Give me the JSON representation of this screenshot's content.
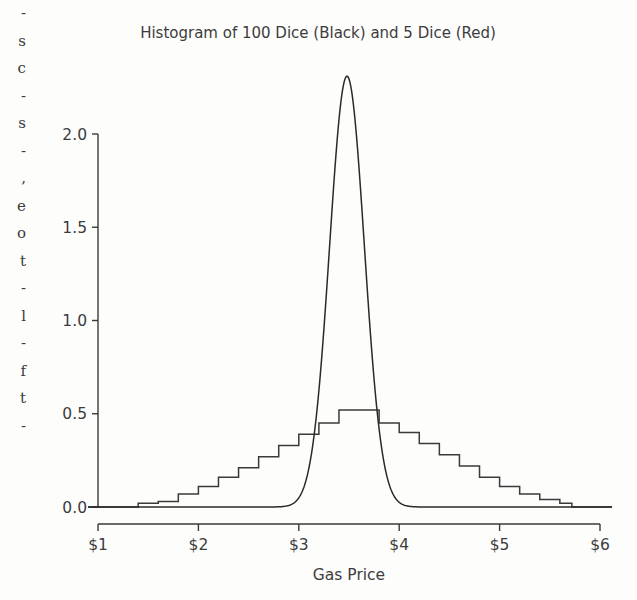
{
  "figure": {
    "background_color": "#fdfdfc",
    "ink_color": "#3a3a3a"
  },
  "scan_artifact": {
    "left_margin_text": "-\ns\nc\n-\ns\n-\n,\ne\no\nt\n-\nl\n-\nf\nt\n-"
  },
  "chart_data": {
    "type": "line",
    "title": "Histogram of 100 Dice (Black) and 5 Dice (Red)",
    "xlabel": "Gas Price",
    "ylabel": "",
    "xlim": [
      0.85,
      6.15
    ],
    "ylim": [
      0.0,
      2.42
    ],
    "grid": false,
    "legend_position": "none",
    "xticks": [
      1,
      2,
      3,
      4,
      5,
      6
    ],
    "xticklabels": [
      "$1",
      "$2",
      "$3",
      "$4",
      "$5",
      "$6"
    ],
    "yticks": [
      0.0,
      0.5,
      1.0,
      1.5,
      2.0
    ],
    "yticklabels": [
      "0.0",
      "0.5",
      "1.0",
      "1.5",
      "2.0"
    ],
    "series": [
      {
        "name": "5 Dice (Red)",
        "label": "5 Dice",
        "color": "#3a3a3a",
        "style": "step",
        "bin_width": 0.2,
        "bin_edges": [
          1.4,
          1.6,
          1.8,
          2.0,
          2.2,
          2.4,
          2.6,
          2.8,
          3.0,
          3.2,
          3.4,
          3.6,
          3.8,
          4.0,
          4.2,
          4.4,
          4.6,
          4.8,
          5.0,
          5.2,
          5.4,
          5.6,
          5.72
        ],
        "values": [
          0.02,
          0.03,
          0.07,
          0.11,
          0.16,
          0.21,
          0.27,
          0.33,
          0.39,
          0.45,
          0.52,
          0.52,
          0.45,
          0.4,
          0.34,
          0.28,
          0.22,
          0.16,
          0.11,
          0.07,
          0.04,
          0.02
        ],
        "baseline_left_x": 0.9,
        "baseline_right_x": 6.12
      },
      {
        "name": "100 Dice (Black)",
        "label": "100 Dice",
        "color": "#2a2a2a",
        "style": "smooth",
        "distribution": "normal",
        "mean": 3.48,
        "stdev": 0.173,
        "peak_value": 2.31,
        "peak_x": 3.48,
        "baseline_left_x": 0.9,
        "baseline_right_x": 6.12
      }
    ]
  },
  "plot_geometry": {
    "left_px": 98,
    "right_px": 600,
    "top_px": 134,
    "bottom_px": 507,
    "x_axis_spine_y_px": 524,
    "title_x_px": 318,
    "title_y_px": 38
  }
}
